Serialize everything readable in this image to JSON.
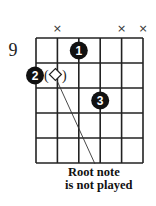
{
  "diagram": {
    "type": "guitar-chord-diagram",
    "start_fret_label": "9",
    "num_strings": 6,
    "num_frets": 5,
    "muted_strings": [
      2,
      5,
      6
    ],
    "mute_symbol": "×",
    "fingers": [
      {
        "finger": "1",
        "string": 3,
        "fret": 1
      },
      {
        "finger": "2",
        "string": 1,
        "fret": 2
      },
      {
        "finger": "3",
        "string": 4,
        "fret": 3
      }
    ],
    "unplayed_root": {
      "string": 2,
      "fret": 2,
      "symbol": "diamond",
      "parentheses": [
        "(",
        ")"
      ]
    },
    "annotation": {
      "line1": "Root note",
      "line2": "is not played"
    },
    "colors": {
      "grid": "#222222",
      "dot": "#111111",
      "dot_text": "#ffffff"
    }
  }
}
